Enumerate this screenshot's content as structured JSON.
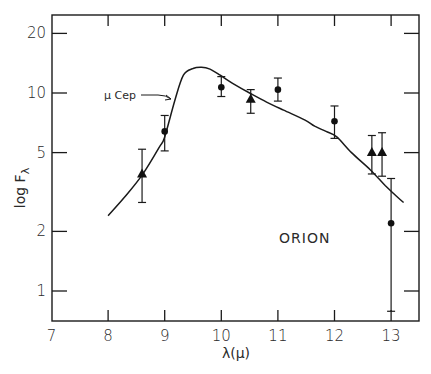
{
  "chart_data": {
    "type": "scatter",
    "title": "",
    "xlabel": "λ(μ)",
    "ylabel": "log F",
    "ylabel_subscript": "λ",
    "xlim": [
      7,
      13.48
    ],
    "ylim": [
      0.7,
      24
    ],
    "yscale": "log",
    "grid": false,
    "x_ticks": [
      7,
      8,
      9,
      10,
      11,
      12,
      13
    ],
    "x_tick_labels": [
      "7",
      "8",
      "9",
      "10",
      "11",
      "12",
      "13"
    ],
    "y_ticks": [
      1,
      2,
      5,
      10,
      20
    ],
    "y_tick_labels": [
      "1",
      "2",
      "5",
      "10",
      "20"
    ],
    "annotations": [
      {
        "text": "μ Cep",
        "points_to": "model-curve",
        "at_x": 9.18
      },
      {
        "text": "ORION",
        "x": 11.2,
        "y": 2.7
      }
    ],
    "series": [
      {
        "name": "μ Cep",
        "kind": "line",
        "x": [
          8.0,
          8.3,
          8.6,
          8.9,
          9.0,
          9.18,
          9.33,
          9.5,
          9.65,
          9.8,
          9.98,
          10.2,
          10.5,
          10.8,
          11.1,
          11.48,
          11.65,
          11.85,
          12.04,
          12.3,
          12.63,
          12.9,
          13.1,
          13.22
        ],
        "y": [
          2.4,
          3.0,
          3.85,
          5.3,
          6.0,
          9.2,
          12.3,
          13.3,
          13.5,
          13.2,
          12.3,
          11.2,
          10.0,
          9.0,
          8.2,
          7.3,
          6.8,
          6.4,
          6.0,
          5.0,
          4.1,
          3.4,
          3.0,
          2.8
        ]
      },
      {
        "name": "circles",
        "kind": "points",
        "marker": "circle",
        "points": [
          {
            "x": 9.0,
            "y": 6.4,
            "ylo": 5.1,
            "yhi": 7.7
          },
          {
            "x": 10.0,
            "y": 10.7,
            "ylo": 9.6,
            "yhi": 12.1
          },
          {
            "x": 11.0,
            "y": 10.4,
            "ylo": 9.1,
            "yhi": 11.9
          },
          {
            "x": 12.0,
            "y": 7.2,
            "ylo": 5.9,
            "yhi": 8.6
          },
          {
            "x": 13.0,
            "y": 2.2,
            "ylo": 0.79,
            "yhi": 3.7
          }
        ]
      },
      {
        "name": "triangles",
        "kind": "points",
        "marker": "triangle",
        "points": [
          {
            "x": 8.6,
            "y": 3.9,
            "ylo": 2.8,
            "yhi": 5.2
          },
          {
            "x": 10.52,
            "y": 9.3,
            "ylo": 7.9,
            "yhi": 10.4
          },
          {
            "x": 12.66,
            "y": 5.0,
            "ylo": 3.9,
            "yhi": 6.1
          },
          {
            "x": 12.84,
            "y": 5.0,
            "ylo": 3.8,
            "yhi": 6.3
          }
        ]
      }
    ]
  }
}
